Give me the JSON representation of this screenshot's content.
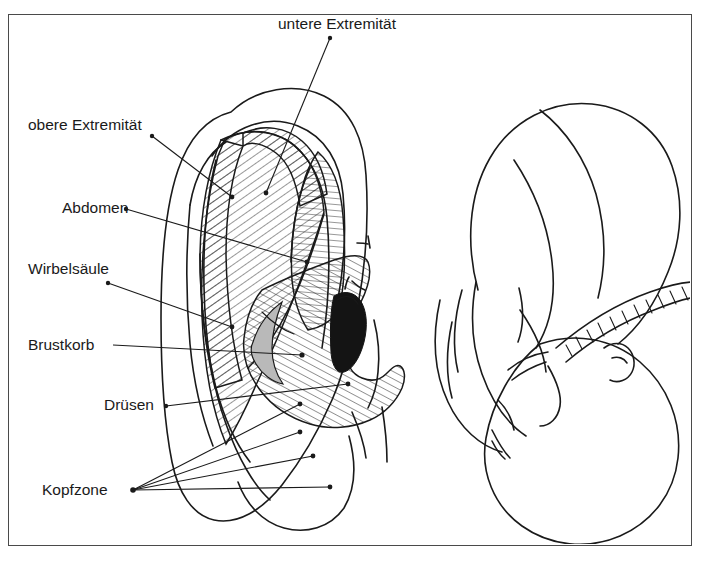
{
  "figure": {
    "language": "de",
    "background_color": "#ffffff",
    "ink_color": "#1a1a1a",
    "border_color": "#4a4a4a"
  },
  "labels": [
    {
      "id": "untere-extremitaet",
      "text": "untere Extremität",
      "x": 278,
      "y": 29,
      "anchor": "start",
      "dot": [
        330,
        38
      ],
      "target": [
        266,
        193
      ]
    },
    {
      "id": "obere-extremitaet",
      "text": "obere Extremität",
      "x": 28,
      "y": 130,
      "anchor": "start",
      "dot": [
        152,
        136
      ],
      "target": [
        232,
        197
      ]
    },
    {
      "id": "abdomen",
      "text": "Abdomen",
      "x": 62,
      "y": 213,
      "anchor": "start",
      "dot": [
        126,
        209
      ],
      "target": [
        307,
        262
      ]
    },
    {
      "id": "wirbelsaeule",
      "text": "Wirbelsäule",
      "x": 28,
      "y": 274,
      "anchor": "start",
      "dot": [
        108,
        283
      ],
      "target": [
        232,
        327
      ]
    },
    {
      "id": "brustkorb",
      "text": "Brustkorb",
      "x": 28,
      "y": 350,
      "anchor": "start",
      "dot": [
        113,
        345
      ],
      "target": [
        302,
        355
      ]
    },
    {
      "id": "druesen",
      "text": "Drüsen",
      "x": 104,
      "y": 410,
      "anchor": "start",
      "dot": [
        166,
        406
      ],
      "target": [
        348,
        384
      ]
    },
    {
      "id": "kopfzone",
      "text": "Kopfzone",
      "x": 42,
      "y": 495,
      "anchor": "start",
      "dot": [
        133,
        490
      ],
      "targets": [
        [
          300,
          404
        ],
        [
          300,
          432
        ],
        [
          313,
          456
        ],
        [
          330,
          487
        ]
      ]
    }
  ],
  "zones": [
    {
      "id": "zone-obere-extremitaet",
      "label": "obere Extremität",
      "hatch": "hatchA"
    },
    {
      "id": "zone-untere-extremitaet",
      "label": "untere Extremität",
      "hatch": "hatchB"
    },
    {
      "id": "zone-abdomen-brustkorb",
      "label": "Abdomen / Brustkorb",
      "hatch": "hatchC"
    },
    {
      "id": "zone-gehoergang",
      "label": "Gehörgang",
      "fill": "#141414"
    },
    {
      "id": "zone-druesen-shade",
      "label": "Drüsen",
      "fill": "#b9b9b9"
    }
  ],
  "drawings": [
    {
      "id": "ear-diagram",
      "caption": "Ohrmuschel mit Reflexzonen"
    },
    {
      "id": "fetus-diagram",
      "caption": "Fetus in Ohrlage"
    }
  ]
}
